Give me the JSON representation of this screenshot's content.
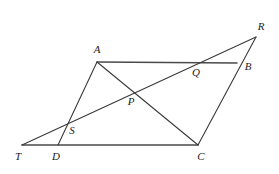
{
  "figure": {
    "background_color": "#ffffff",
    "stroke_color": "#3a3a3a",
    "label_color": "#1c1c1c",
    "width": 279,
    "height": 174
  },
  "points": {
    "A": {
      "label": "A",
      "x": 97,
      "y": 62,
      "label_x": 97,
      "label_y": 50
    },
    "B": {
      "label": "B",
      "x": 237,
      "y": 63,
      "label_x": 248,
      "label_y": 67
    },
    "C": {
      "label": "C",
      "x": 198,
      "y": 145,
      "label_x": 201,
      "label_y": 157
    },
    "D": {
      "label": "D",
      "x": 58,
      "y": 145,
      "label_x": 56,
      "label_y": 157
    },
    "R": {
      "label": "R",
      "x": 256,
      "y": 37,
      "label_x": 261,
      "label_y": 27
    },
    "T": {
      "label": "T",
      "x": 22,
      "y": 145,
      "label_x": 18,
      "label_y": 157
    },
    "P": {
      "label": "P",
      "x": 134,
      "y": 92,
      "label_x": 131,
      "label_y": 102
    },
    "Q": {
      "label": "Q",
      "x": 197,
      "y": 63,
      "label_x": 196,
      "label_y": 73
    },
    "S": {
      "label": "S",
      "x": 63,
      "y": 124,
      "label_x": 72,
      "label_y": 131
    }
  },
  "segments": [
    {
      "name": "segment-A-B",
      "from": "A",
      "to": "B",
      "weight": "thick"
    },
    {
      "name": "segment-T-C",
      "from": "T",
      "to": "C",
      "weight": "thick"
    },
    {
      "name": "segment-D-A",
      "from": "D",
      "to": "A",
      "weight": "thin"
    },
    {
      "name": "segment-A-C",
      "from": "A",
      "to": "C",
      "weight": "thin"
    },
    {
      "name": "segment-C-R",
      "from": "C",
      "to": "R",
      "weight": "thin"
    },
    {
      "name": "segment-T-R",
      "from": "T",
      "to": "R",
      "weight": "thin"
    }
  ],
  "label_order": [
    "R",
    "A",
    "B",
    "Q",
    "P",
    "S",
    "T",
    "D",
    "C"
  ]
}
